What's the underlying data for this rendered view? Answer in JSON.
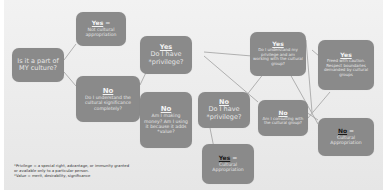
{
  "colors": {
    "node_fill": "#8a8a8a",
    "node_text": "#e9e9e9",
    "background": "#ececec",
    "connector": "#9a9a9a",
    "footnote_text": "#333333"
  },
  "nodes": {
    "start": {
      "head": "",
      "body": "Is it a part of MY culture?"
    },
    "yes_not_approp": {
      "head": "Yes",
      "suffix": " =",
      "body": "Not cultural appropriation"
    },
    "no_understand": {
      "head": "No",
      "body": "Do I understand the cultural significance completely?"
    },
    "yes_privilege": {
      "head": "Yes",
      "body": "Do I have *privilege?"
    },
    "no_money": {
      "head": "No",
      "body": "Am I making money? Am I using it because it adds *value?"
    },
    "no_privilege": {
      "head": "No",
      "body": "Do I have *privilege?"
    },
    "yes_working": {
      "head": "Yes",
      "body": "Do I understand my privilege and am working with the cultural group?"
    },
    "yes_freed": {
      "head": "Yes",
      "body": "Freed with caution. Respect boundaries demanded by cultural groups"
    },
    "no_consulting": {
      "head": "No",
      "body": "Am I consulting with the cultural group?"
    },
    "yes_approp": {
      "head": "Yes",
      "suffix": " =",
      "body": "Cultural Appropriation"
    },
    "no_approp": {
      "head": "No",
      "suffix": " =",
      "body": "Cultural Appropriation"
    }
  },
  "footnote": {
    "line1": "*Privilege = a special right, advantage, or immunity granted",
    "line2": "or available only to a particular person.",
    "line3": "*Value = merit, desirability, significance"
  }
}
